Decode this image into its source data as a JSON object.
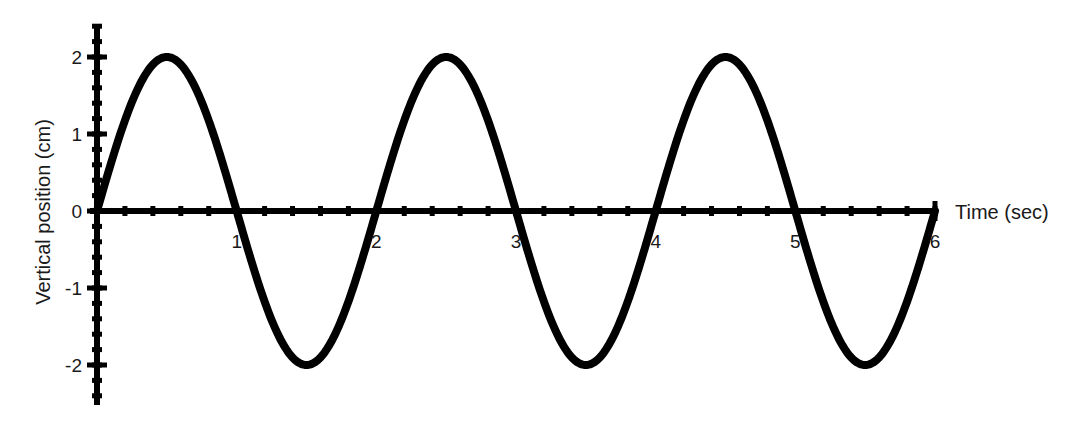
{
  "chart_data": {
    "type": "line",
    "title": "",
    "xlabel": "Time (sec)",
    "ylabel": "Vertical position (cm)",
    "xlim": [
      0,
      6
    ],
    "ylim": [
      -2.4,
      2.4
    ],
    "x_ticks": [
      "1",
      "2",
      "3",
      "4",
      "5",
      "6"
    ],
    "y_ticks": [
      "2",
      "1",
      "0",
      "-1",
      "-2"
    ],
    "minor_tick_step": 0.2,
    "grid": false,
    "legend": null,
    "series": [
      {
        "name": "vertical position",
        "function": "y = 2 sin(pi t)",
        "amplitude": 2,
        "period": 2,
        "x": [
          0,
          0.5,
          1,
          1.5,
          2,
          2.5,
          3,
          3.5,
          4,
          4.5,
          5,
          5.5,
          6
        ],
        "values": [
          0,
          2,
          0,
          -2,
          0,
          2,
          0,
          -2,
          0,
          2,
          0,
          -2,
          0
        ],
        "color": "#000000"
      }
    ]
  }
}
